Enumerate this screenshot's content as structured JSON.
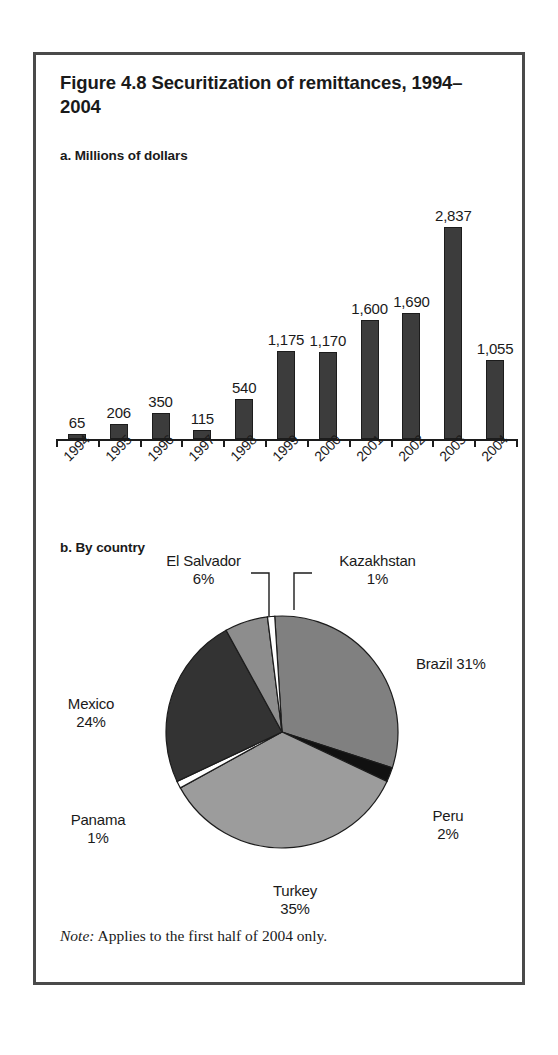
{
  "figure": {
    "title": "Figure 4.8  Securitization of remittances, 1994–2004",
    "note_word": "Note:",
    "note_text": " Applies to the first half of 2004 only.",
    "frame_color": "#4a4a4a"
  },
  "panel_a": {
    "label": "a. Millions of dollars"
  },
  "panel_b": {
    "label": "b. By country"
  },
  "chart_data": [
    {
      "type": "bar",
      "title": "a. Millions of dollars",
      "xlabel": "",
      "ylabel": "Millions of dollars",
      "ylim": [
        0,
        3000
      ],
      "grid": false,
      "legend": "none",
      "bar_color": "#3c3c3c",
      "categories": [
        "1994",
        "1995",
        "1996",
        "1997",
        "1998",
        "1999",
        "2000",
        "2001",
        "2002",
        "2003",
        "2004"
      ],
      "values": [
        65,
        206,
        350,
        115,
        540,
        1175,
        1170,
        1600,
        1690,
        2837,
        1055
      ],
      "value_labels": [
        "65",
        "206",
        "350",
        "115",
        "540",
        "1,175",
        "1,170",
        "1,600",
        "1,690",
        "2,837",
        "1,055"
      ]
    },
    {
      "type": "pie",
      "title": "b. By country",
      "legend": "none",
      "labels": [
        "Brazil",
        "Peru",
        "Turkey",
        "Panama",
        "Mexico",
        "El Salvador",
        "Kazakhstan"
      ],
      "values": [
        31,
        2,
        35,
        1,
        24,
        6,
        1
      ],
      "value_labels": [
        "31%",
        "2%",
        "35%",
        "1%",
        "24%",
        "6%",
        "1%"
      ],
      "colors": [
        "#808080",
        "#111111",
        "#9c9c9c",
        "#ffffff",
        "#333333",
        "#8d8d8d",
        "#ffffff"
      ],
      "slice_labels": [
        {
          "name": "Brazil",
          "text": "Brazil 31%",
          "placement": "right"
        },
        {
          "name": "Peru",
          "text": "Peru",
          "value": "2%",
          "placement": "right"
        },
        {
          "name": "Turkey",
          "text": "Turkey",
          "value": "35%",
          "placement": "bottom"
        },
        {
          "name": "Panama",
          "text": "Panama",
          "value": "1%",
          "placement": "left"
        },
        {
          "name": "Mexico",
          "text": "Mexico",
          "value": "24%",
          "placement": "left"
        },
        {
          "name": "El Salvador",
          "text": "El Salvador",
          "value": "6%",
          "placement": "top-leader"
        },
        {
          "name": "Kazakhstan",
          "text": "Kazakhstan",
          "value": "1%",
          "placement": "top-leader"
        }
      ]
    }
  ],
  "bars": [
    {
      "year": "1994",
      "label": "65",
      "value": 65
    },
    {
      "year": "1995",
      "label": "206",
      "value": 206
    },
    {
      "year": "1996",
      "label": "350",
      "value": 350
    },
    {
      "year": "1997",
      "label": "115",
      "value": 115
    },
    {
      "year": "1998",
      "label": "540",
      "value": 540
    },
    {
      "year": "1999",
      "label": "1,175",
      "value": 1175
    },
    {
      "year": "2000",
      "label": "1,170",
      "value": 1170
    },
    {
      "year": "2001",
      "label": "1,600",
      "value": 1600
    },
    {
      "year": "2002",
      "label": "1,690",
      "value": 1690
    },
    {
      "year": "2003",
      "label": "2,837",
      "value": 2837
    },
    {
      "year": "2004",
      "label": "1,055",
      "value": 1055
    }
  ],
  "pie_labels": {
    "el_salvador_name": "El Salvador",
    "el_salvador_value": "6%",
    "kazakhstan_name": "Kazakhstan",
    "kazakhstan_value": "1%",
    "brazil": "Brazil 31%",
    "peru_name": "Peru",
    "peru_value": "2%",
    "turkey_name": "Turkey",
    "turkey_value": "35%",
    "panama_name": "Panama",
    "panama_value": "1%",
    "mexico_name": "Mexico",
    "mexico_value": "24%"
  }
}
